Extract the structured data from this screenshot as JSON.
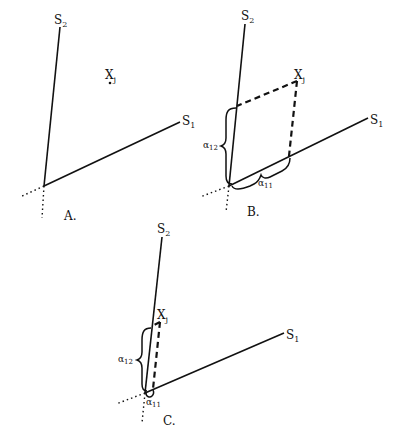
{
  "figure": {
    "panels": [
      {
        "id": "A",
        "label": "A.",
        "axis_s1_label": "S",
        "axis_s1_sub": "1",
        "axis_s2_label": "S",
        "axis_s2_sub": "2",
        "point_label": "X",
        "point_sub": "j"
      },
      {
        "id": "B",
        "label": "B.",
        "axis_s1_label": "S",
        "axis_s1_sub": "1",
        "axis_s2_label": "S",
        "axis_s2_sub": "2",
        "point_label": "X",
        "point_sub": "j",
        "coef_12": "α",
        "coef_12_sub": "12",
        "coef_11": "α",
        "coef_11_sub": "11"
      },
      {
        "id": "C",
        "label": "C.",
        "axis_s1_label": "S",
        "axis_s1_sub": "1",
        "axis_s2_label": "S",
        "axis_s2_sub": "2",
        "point_label": "X",
        "point_sub": "j",
        "coef_12": "α",
        "coef_12_sub": "12",
        "coef_11": "α",
        "coef_11_sub": "11"
      }
    ]
  }
}
